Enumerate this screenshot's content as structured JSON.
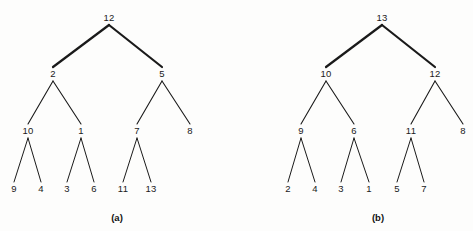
{
  "figure": {
    "type": "binary-tree-diagram",
    "background_color": "#fdfdfc",
    "stroke_color": "#1a1a1a",
    "text_color": "#1a1a1a"
  },
  "chart_data": {
    "type": "diagram",
    "title": "",
    "panels": [
      {
        "caption": "(a)",
        "caption_x": 117,
        "caption_y": 217,
        "root": "12",
        "levels": [
          [
            "12"
          ],
          [
            "2",
            "5"
          ],
          [
            "10",
            "1",
            "7",
            "8"
          ],
          [
            "9",
            "4",
            "3",
            "6",
            "11",
            "13"
          ]
        ],
        "nodes": [
          {
            "id": "a-root",
            "label": "12",
            "x": 109,
            "y": 18,
            "level": 0
          },
          {
            "id": "a-l",
            "label": "2",
            "x": 53,
            "y": 74,
            "level": 1
          },
          {
            "id": "a-r",
            "label": "5",
            "x": 162,
            "y": 74,
            "level": 1
          },
          {
            "id": "a-ll",
            "label": "10",
            "x": 28,
            "y": 131,
            "level": 2
          },
          {
            "id": "a-lr",
            "label": "1",
            "x": 81,
            "y": 131,
            "level": 2
          },
          {
            "id": "a-rl",
            "label": "7",
            "x": 137,
            "y": 131,
            "level": 2
          },
          {
            "id": "a-rr",
            "label": "8",
            "x": 190,
            "y": 131,
            "level": 2
          },
          {
            "id": "a-lll",
            "label": "9",
            "x": 14,
            "y": 189,
            "level": 3
          },
          {
            "id": "a-llr",
            "label": "4",
            "x": 41,
            "y": 189,
            "level": 3
          },
          {
            "id": "a-lrl",
            "label": "3",
            "x": 67,
            "y": 189,
            "level": 3
          },
          {
            "id": "a-lrr",
            "label": "6",
            "x": 94,
            "y": 189,
            "level": 3
          },
          {
            "id": "a-rll",
            "label": "11",
            "x": 123,
            "y": 189,
            "level": 3
          },
          {
            "id": "a-rlr",
            "label": "13",
            "x": 151,
            "y": 189,
            "level": 3
          }
        ],
        "edges": [
          {
            "from": "a-root",
            "to": "a-l",
            "width": 2.2
          },
          {
            "from": "a-root",
            "to": "a-r",
            "width": 2.2
          },
          {
            "from": "a-l",
            "to": "a-ll",
            "width": 1.1
          },
          {
            "from": "a-l",
            "to": "a-lr",
            "width": 1.1
          },
          {
            "from": "a-r",
            "to": "a-rl",
            "width": 1.1
          },
          {
            "from": "a-r",
            "to": "a-rr",
            "width": 1.1
          },
          {
            "from": "a-ll",
            "to": "a-lll",
            "width": 1.0
          },
          {
            "from": "a-ll",
            "to": "a-llr",
            "width": 1.0
          },
          {
            "from": "a-lr",
            "to": "a-lrl",
            "width": 1.0
          },
          {
            "from": "a-lr",
            "to": "a-lrr",
            "width": 1.0
          },
          {
            "from": "a-rl",
            "to": "a-rll",
            "width": 1.0
          },
          {
            "from": "a-rl",
            "to": "a-rlr",
            "width": 1.0
          }
        ]
      },
      {
        "caption": "(b)",
        "caption_x": 378,
        "caption_y": 217,
        "root": "13",
        "levels": [
          [
            "13"
          ],
          [
            "10",
            "12"
          ],
          [
            "9",
            "6",
            "11",
            "8"
          ],
          [
            "2",
            "4",
            "3",
            "1",
            "5",
            "7"
          ]
        ],
        "nodes": [
          {
            "id": "b-root",
            "label": "13",
            "x": 382,
            "y": 18,
            "level": 0
          },
          {
            "id": "b-l",
            "label": "10",
            "x": 326,
            "y": 74,
            "level": 1
          },
          {
            "id": "b-r",
            "label": "12",
            "x": 435,
            "y": 74,
            "level": 1
          },
          {
            "id": "b-ll",
            "label": "9",
            "x": 301,
            "y": 131,
            "level": 2
          },
          {
            "id": "b-lr",
            "label": "6",
            "x": 354,
            "y": 131,
            "level": 2
          },
          {
            "id": "b-rl",
            "label": "11",
            "x": 411,
            "y": 131,
            "level": 2
          },
          {
            "id": "b-rr",
            "label": "8",
            "x": 463,
            "y": 131,
            "level": 2
          },
          {
            "id": "b-lll",
            "label": "2",
            "x": 288,
            "y": 189,
            "level": 3
          },
          {
            "id": "b-llr",
            "label": "4",
            "x": 315,
            "y": 189,
            "level": 3
          },
          {
            "id": "b-lrl",
            "label": "3",
            "x": 341,
            "y": 189,
            "level": 3
          },
          {
            "id": "b-lrr",
            "label": "1",
            "x": 369,
            "y": 189,
            "level": 3
          },
          {
            "id": "b-rll",
            "label": "5",
            "x": 397,
            "y": 189,
            "level": 3
          },
          {
            "id": "b-rlr",
            "label": "7",
            "x": 424,
            "y": 189,
            "level": 3
          }
        ],
        "edges": [
          {
            "from": "b-root",
            "to": "b-l",
            "width": 2.2
          },
          {
            "from": "b-root",
            "to": "b-r",
            "width": 2.2
          },
          {
            "from": "b-l",
            "to": "b-ll",
            "width": 1.1
          },
          {
            "from": "b-l",
            "to": "b-lr",
            "width": 1.1
          },
          {
            "from": "b-r",
            "to": "b-rl",
            "width": 1.1
          },
          {
            "from": "b-r",
            "to": "b-rr",
            "width": 1.1
          },
          {
            "from": "b-ll",
            "to": "b-lll",
            "width": 1.0
          },
          {
            "from": "b-ll",
            "to": "b-llr",
            "width": 1.0
          },
          {
            "from": "b-lr",
            "to": "b-lrl",
            "width": 1.0
          },
          {
            "from": "b-lr",
            "to": "b-lrr",
            "width": 1.0
          },
          {
            "from": "b-rl",
            "to": "b-rll",
            "width": 1.0
          },
          {
            "from": "b-rl",
            "to": "b-rlr",
            "width": 1.0
          }
        ]
      }
    ]
  }
}
